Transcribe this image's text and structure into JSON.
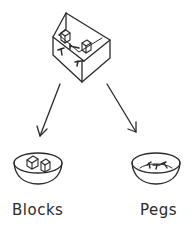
{
  "diagram": {
    "source": {
      "name": "box",
      "contents": [
        "blocks",
        "pegs"
      ]
    },
    "targets": [
      {
        "name": "bowl-blocks",
        "label": "Blocks",
        "contents": "blocks"
      },
      {
        "name": "bowl-pegs",
        "label": "Pegs",
        "contents": "pegs"
      }
    ],
    "edges": [
      {
        "from": "box",
        "to": "bowl-blocks"
      },
      {
        "from": "box",
        "to": "bowl-pegs"
      }
    ],
    "stroke_color": "#2a2a2a"
  }
}
